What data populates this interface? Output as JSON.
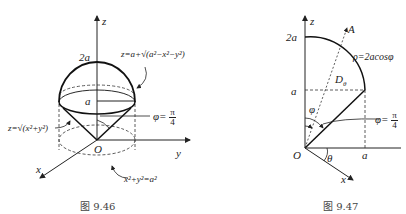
{
  "figures": [
    {
      "caption": "图 9.46",
      "labels": {
        "z_axis": "z",
        "y_axis": "y",
        "x_axis": "x",
        "origin": "O",
        "top": "2a",
        "mid": "a",
        "sphere_eq": "z=a+√(a²−x²−y²)",
        "cone_eq": "z=√(x²+y²)",
        "angle_lhs": "φ=",
        "angle_num": "π",
        "angle_den": "4",
        "circle_eq": "x²+y²=a²"
      }
    },
    {
      "caption": "图 9.47",
      "labels": {
        "z_axis": "z",
        "x_axis": "x",
        "origin": "O",
        "top": "2a",
        "mid": "a",
        "right_a": "a",
        "ray": "A",
        "curve_eq": "ρ=2acosφ",
        "region": "D",
        "region_sub": "θ",
        "phi": "φ",
        "theta": "θ",
        "angle_lhs": "φ=",
        "angle_num": "π",
        "angle_den": "4"
      }
    }
  ]
}
